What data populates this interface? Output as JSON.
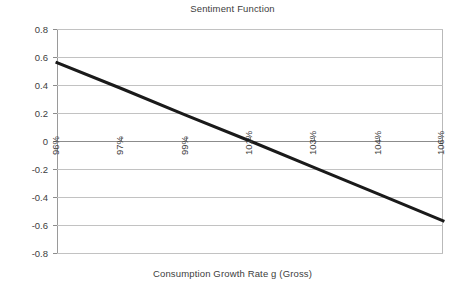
{
  "chart_data": {
    "type": "line",
    "title": "Sentiment Function",
    "xlabel": "Consumption Growth Rate g (Gross)",
    "ylabel": "",
    "grid": true,
    "legend": "none",
    "xlim": [
      0,
      6
    ],
    "ylim": [
      -0.8,
      0.8
    ],
    "categories": [
      "96%",
      "97%",
      "99%",
      "101%",
      "103%",
      "104%",
      "106%"
    ],
    "x_tick_labels": [
      "96%",
      "97%",
      "99%",
      "101%",
      "103%",
      "104%",
      "106%"
    ],
    "x_tick_rotation": -90,
    "y_tick_labels": [
      "0.8",
      "0.6",
      "0.4",
      "0.2",
      "0",
      "-0.2",
      "-0.4",
      "-0.6",
      "-0.8"
    ],
    "y_tick_values": [
      0.8,
      0.6,
      0.4,
      0.2,
      0,
      -0.2,
      -0.4,
      -0.6,
      -0.8
    ],
    "series": [
      {
        "name": "Sentiment",
        "color": "#1a1a1a",
        "line_width": 3,
        "x": [
          0,
          6
        ],
        "values": [
          0.56,
          -0.57
        ],
        "points": [
          {
            "x": "96%",
            "y": 0.56
          },
          {
            "x": "97%",
            "y": 0.375
          },
          {
            "x": "99%",
            "y": 0.185
          },
          {
            "x": "101%",
            "y": 0.0
          },
          {
            "x": "103%",
            "y": -0.19
          },
          {
            "x": "104%",
            "y": -0.38
          },
          {
            "x": "106%",
            "y": -0.57
          }
        ]
      }
    ],
    "annotations": [],
    "zero_crossing": "between 101% and 103%"
  },
  "colors": {
    "gridline": "#c2c2c2",
    "zero_line": "#8c8c8c",
    "axis": "#9a9a9a",
    "text": "#3d3d3d",
    "series": "#1a1a1a",
    "background": "#ffffff"
  }
}
